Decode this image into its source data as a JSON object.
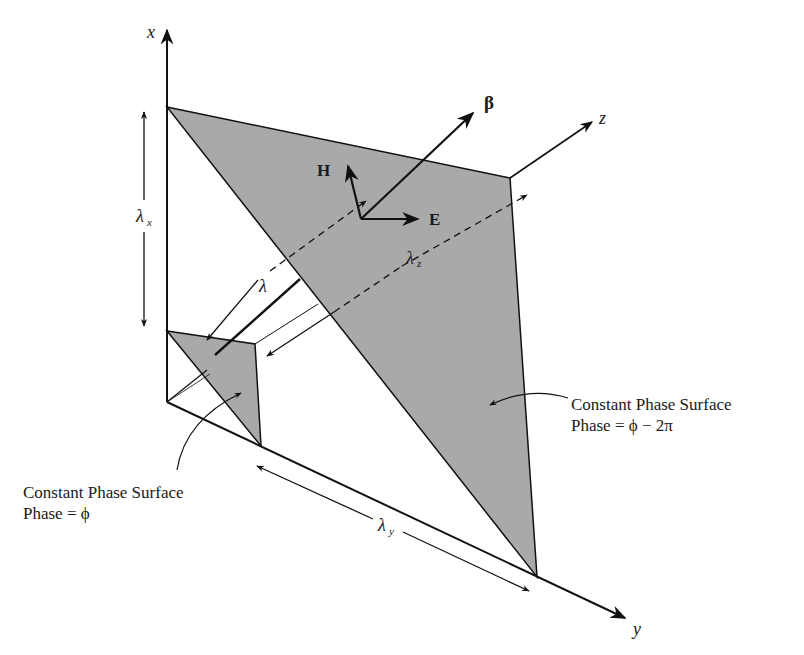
{
  "diagram": {
    "axes": {
      "x": "x",
      "y": "y",
      "z": "z"
    },
    "vectors": {
      "beta": "β",
      "H": "H",
      "E": "E"
    },
    "wavelengths": {
      "lambda_x": "λ",
      "lambda_x_sub": "x",
      "lambda_y": "λ",
      "lambda_y_sub": "y",
      "lambda_z": "λ",
      "lambda_z_sub": "z",
      "lambda": "λ"
    },
    "surface_near": {
      "title": "Constant Phase Surface",
      "phase": "Phase = ϕ"
    },
    "surface_far": {
      "title": "Constant Phase Surface",
      "phase": "Phase = ϕ − 2π"
    },
    "colors": {
      "surface_fill": "#a9a9a9",
      "line": "#111111",
      "background": "#ffffff"
    }
  }
}
